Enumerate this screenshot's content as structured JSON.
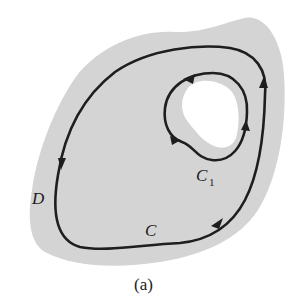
{
  "figure": {
    "caption": "(a)",
    "region_label": "D",
    "outer_curve_label": "C",
    "inner_curve_label": "C",
    "inner_curve_subscript": "1",
    "colors": {
      "region_fill": "#d4d4d4",
      "hole_fill": "#ffffff",
      "curve_stroke": "#1e1e1e",
      "background": "#ffffff"
    },
    "orientation": {
      "outer_curve": "counterclockwise",
      "inner_curve": "clockwise"
    }
  }
}
